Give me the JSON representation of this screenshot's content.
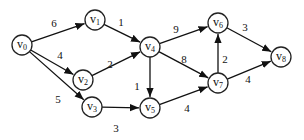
{
  "graph": {
    "type": "directed-weighted",
    "nodes": [
      {
        "id": "v0",
        "base": "v",
        "sub": "0",
        "x": 22,
        "y": 45
      },
      {
        "id": "v1",
        "base": "v",
        "sub": "1",
        "x": 95,
        "y": 20
      },
      {
        "id": "v2",
        "base": "v",
        "sub": "2",
        "x": 83,
        "y": 80
      },
      {
        "id": "v3",
        "base": "v",
        "sub": "3",
        "x": 92,
        "y": 107
      },
      {
        "id": "v4",
        "base": "v",
        "sub": "4",
        "x": 150,
        "y": 47
      },
      {
        "id": "v5",
        "base": "v",
        "sub": "5",
        "x": 150,
        "y": 108
      },
      {
        "id": "v6",
        "base": "v",
        "sub": "6",
        "x": 218,
        "y": 23
      },
      {
        "id": "v7",
        "base": "v",
        "sub": "7",
        "x": 218,
        "y": 83
      },
      {
        "id": "v8",
        "base": "v",
        "sub": "8",
        "x": 281,
        "y": 57
      }
    ],
    "edges": [
      {
        "from": "v0",
        "to": "v1",
        "weight": "6",
        "lx": 54,
        "ly": 27
      },
      {
        "from": "v0",
        "to": "v2",
        "weight": "4",
        "lx": 60,
        "ly": 59
      },
      {
        "from": "v0",
        "to": "v3",
        "weight": "5",
        "lx": 58,
        "ly": 103
      },
      {
        "from": "v1",
        "to": "v4",
        "weight": "1",
        "lx": 121,
        "ly": 26
      },
      {
        "from": "v2",
        "to": "v4",
        "weight": "2",
        "lx": 110,
        "ly": 68
      },
      {
        "from": "v3",
        "to": "v5",
        "weight": "3",
        "lx": 116,
        "ly": 132
      },
      {
        "from": "v4",
        "to": "v5",
        "weight": "1",
        "lx": 137,
        "ly": 90
      },
      {
        "from": "v4",
        "to": "v6",
        "weight": "9",
        "lx": 176,
        "ly": 33
      },
      {
        "from": "v4",
        "to": "v7",
        "weight": "8",
        "lx": 184,
        "ly": 63
      },
      {
        "from": "v5",
        "to": "v7",
        "weight": "4",
        "lx": 187,
        "ly": 112
      },
      {
        "from": "v7",
        "to": "v6",
        "weight": "2",
        "lx": 225,
        "ly": 63
      },
      {
        "from": "v6",
        "to": "v8",
        "weight": "3",
        "lx": 245,
        "ly": 31
      },
      {
        "from": "v7",
        "to": "v8",
        "weight": "4",
        "lx": 248,
        "ly": 83
      }
    ]
  }
}
